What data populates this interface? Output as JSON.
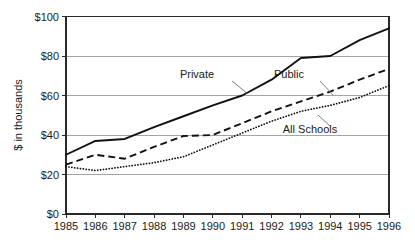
{
  "chart_data": {
    "type": "line",
    "title": "",
    "subtitle": "",
    "xlabel": "",
    "ylabel": "$ in thousands",
    "categories": [
      "1985",
      "1986",
      "1987",
      "1988",
      "1989",
      "1990",
      "1991",
      "1992",
      "1993",
      "1994",
      "1995",
      "1996"
    ],
    "x": [
      1985,
      1986,
      1987,
      1988,
      1989,
      1990,
      1991,
      1992,
      1993,
      1994,
      1995,
      1996
    ],
    "xlim": [
      1985,
      1996
    ],
    "ylim": [
      0,
      100
    ],
    "y_ticks": [
      0,
      20,
      40,
      60,
      80,
      100
    ],
    "y_tick_labels": [
      "$0",
      "$20",
      "$40",
      "$60",
      "$80",
      "$100"
    ],
    "x_tick_labels": [
      "1985",
      "1986",
      "1987",
      "1988",
      "1989",
      "1990",
      "1991",
      "1992",
      "1993",
      "1994",
      "1995",
      "1996"
    ],
    "grid": "horizontal",
    "legend_position": "inline-annotations",
    "series": [
      {
        "name": "Private",
        "style": "solid",
        "color": "#111111",
        "values": [
          30,
          37,
          38,
          44,
          49.5,
          55,
          60,
          68,
          79,
          80,
          88,
          94
        ]
      },
      {
        "name": "Public",
        "style": "dashed",
        "color": "#111111",
        "values": [
          25,
          30,
          28,
          34,
          39.5,
          40,
          46,
          52,
          57,
          62,
          68,
          73.5
        ]
      },
      {
        "name": "All Schools",
        "style": "dotted",
        "color": "#111111",
        "values": [
          24,
          22,
          24,
          26,
          29,
          35,
          41,
          47,
          52,
          55,
          59,
          65
        ]
      }
    ],
    "annotations": [
      {
        "text": "Private",
        "label_x": 197,
        "label_y": 78,
        "leader": [
          [
            232,
            81
          ],
          [
            248,
            94
          ]
        ]
      },
      {
        "text": "Public",
        "label_x": 289,
        "label_y": 78,
        "leader": [
          [
            320,
            81
          ],
          [
            333,
            95
          ]
        ]
      },
      {
        "text": "All Schools",
        "label_x": 310,
        "label_y": 133,
        "leader": [
          [
            330,
            126
          ],
          [
            318,
            115
          ]
        ]
      }
    ]
  }
}
